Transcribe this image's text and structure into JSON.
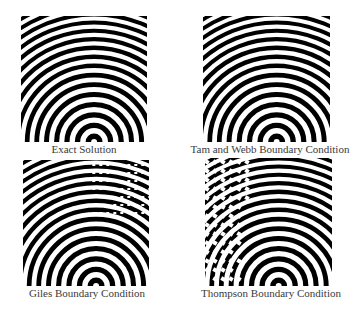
{
  "figure": {
    "panels": [
      {
        "id": "exact",
        "caption": "Exact Solution",
        "x": 21,
        "y": 16,
        "w": 126,
        "h": 126,
        "cap_x": 84,
        "cap_y": 143,
        "artifact": "none"
      },
      {
        "id": "tam-webb",
        "caption": "Tam and Webb Boundary Condition",
        "x": 203,
        "y": 16,
        "w": 127,
        "h": 126,
        "cap_x": 270,
        "cap_y": 143,
        "artifact": "none"
      },
      {
        "id": "giles",
        "caption": "Giles Boundary Condition",
        "x": 23,
        "y": 160,
        "w": 126,
        "h": 126,
        "cap_x": 87,
        "cap_y": 287,
        "artifact": "top-right"
      },
      {
        "id": "thompson",
        "caption": "Thompson Boundary Condition",
        "x": 205,
        "y": 158,
        "w": 127,
        "h": 128,
        "cap_x": 271,
        "cap_y": 287,
        "artifact": "left-top"
      }
    ],
    "source": {
      "x_frac": 0.58,
      "y_frac": 1.0
    },
    "ring_spacing": 5.0
  }
}
